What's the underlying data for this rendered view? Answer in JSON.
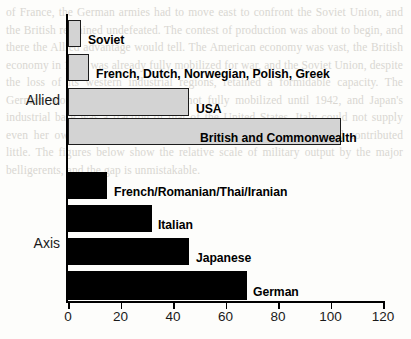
{
  "chart_data": {
    "type": "bar",
    "orientation": "horizontal",
    "title": "",
    "xlabel": "",
    "ylabel": "",
    "xlim": [
      0,
      120
    ],
    "xticks": [
      0,
      20,
      40,
      60,
      80,
      100,
      120
    ],
    "xtick_labels": [
      "0",
      "20",
      "40",
      "60",
      "80",
      "100",
      "120"
    ],
    "grid": false,
    "legend": false,
    "groups": [
      {
        "name": "Allied",
        "color": "#d3d3d3",
        "bars": [
          {
            "label": "Soviet",
            "value": 5
          },
          {
            "label": "French, Dutch, Norwegian, Polish, Greek",
            "value": 8
          },
          {
            "label": "USA",
            "value": 46
          },
          {
            "label": "British and Commonwealth",
            "value": 104
          }
        ]
      },
      {
        "name": "Axis",
        "color": "#000000",
        "bars": [
          {
            "label": "French/Romanian/Thai/Iranian",
            "value": 15
          },
          {
            "label": "Italian",
            "value": 32
          },
          {
            "label": "Japanese",
            "value": 46
          },
          {
            "label": "German",
            "value": 68
          }
        ]
      }
    ],
    "categories": [
      "Soviet",
      "French, Dutch, Norwegian, Polish, Greek",
      "USA",
      "British and Commonwealth",
      "French/Romanian/Thai/Iranian",
      "Italian",
      "Japanese",
      "German"
    ],
    "values": [
      5,
      8,
      46,
      104,
      15,
      32,
      46,
      68
    ]
  },
  "bars": [
    {
      "label": "Soviet",
      "value": 5,
      "group": "allied",
      "top": 20,
      "height": 27,
      "label_x": 88,
      "label_y": 33
    },
    {
      "label": "French, Dutch, Norwegian, Polish, Greek",
      "value": 8,
      "group": "allied",
      "top": 54,
      "height": 27,
      "label_x": 96,
      "label_y": 67
    },
    {
      "label": "USA",
      "value": 46,
      "group": "allied",
      "top": 88,
      "height": 28,
      "label_x": 196,
      "label_y": 102
    },
    {
      "label": "British and Commonwealth",
      "value": 104,
      "group": "allied",
      "top": 118,
      "height": 27,
      "label_x": 200,
      "label_y": 131
    },
    {
      "label": "French/Romanian/Thai/Iranian",
      "value": 15,
      "group": "axis",
      "top": 172,
      "height": 27,
      "label_x": 114,
      "label_y": 185
    },
    {
      "label": "Italian",
      "value": 32,
      "group": "axis",
      "top": 205,
      "height": 27,
      "label_x": 158,
      "label_y": 218
    },
    {
      "label": "Japanese",
      "value": 46,
      "group": "axis",
      "top": 238,
      "height": 27,
      "label_x": 196,
      "label_y": 251
    },
    {
      "label": "German",
      "value": 68,
      "group": "axis",
      "top": 271,
      "height": 29,
      "label_x": 253,
      "label_y": 285
    }
  ],
  "group_labels": [
    {
      "name": "Allied",
      "top": 92,
      "right": 60
    },
    {
      "name": "Axis",
      "top": 235,
      "right": 60
    }
  ],
  "ghost_text": "of France, the German armies had to move east to confront the Soviet Union, and the British remained undefeated. The contest of production was about to begin, and there the Allied advantage would tell. The American economy was vast, the British economy in 1940 was already fully mobilized for war, and the Soviet Union, despite the loss of its western industrial regions, retained a formidable capacity. The German economy, by contrast, was not fully mobilized until 1942, and Japan's industrial base was a fraction of that of the United States. Italy could not supply even her own modest forces, and Romania, Hungary, and Thailand contributed little. The figures below show the relative scale of military output by the major belligerents, and the gap is unmistakable."
}
